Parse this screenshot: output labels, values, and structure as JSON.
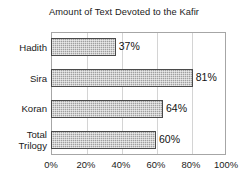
{
  "chart_data": {
    "type": "bar",
    "orientation": "horizontal",
    "title": "Amount of Text Devoted to the Kafir",
    "xlabel": "",
    "ylabel": "",
    "categories": [
      "Hadith",
      "Sira",
      "Koran",
      "Total Trilogy"
    ],
    "values": [
      37,
      81,
      64,
      60
    ],
    "data_labels": [
      "37%",
      "81%",
      "64%",
      "60%"
    ],
    "xlim": [
      0,
      100
    ],
    "xticks": [
      0,
      20,
      40,
      60,
      80,
      100
    ],
    "xtick_labels": [
      "0%",
      "20%",
      "40%",
      "60%",
      "80%",
      "100%"
    ],
    "grid": "vertical",
    "legend": "none",
    "bar_fill_color": "#a0a0a0",
    "bar_border_color": "#4a4a4a",
    "gridline_color": "#d4d4d4",
    "axis_border_color": "#a6a6a6",
    "text_color": "#1a1a1a",
    "background_color": "#ffffff"
  },
  "category_label_lines": [
    [
      "Hadith"
    ],
    [
      "Sira"
    ],
    [
      "Koran"
    ],
    [
      "Total",
      "Trilogy"
    ]
  ]
}
